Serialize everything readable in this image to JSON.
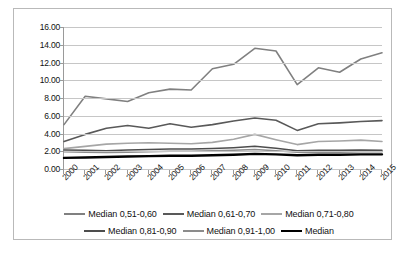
{
  "chart_data": {
    "type": "line",
    "title": "",
    "xlabel": "",
    "ylabel": "",
    "x": [
      "2000",
      "2001",
      "2002",
      "2003",
      "2004",
      "2005",
      "2006",
      "2007",
      "2008",
      "2009",
      "2010",
      "2011",
      "2012",
      "2013",
      "2014",
      "2015"
    ],
    "ylim": [
      0,
      16
    ],
    "ytick_step": 2.0,
    "ytick_labels": [
      "16.00",
      "14.00",
      "12.00",
      "10.00",
      "8.00",
      "6.00",
      "4.00",
      "2.00",
      "0.00"
    ],
    "grid": true,
    "legend_position": "bottom",
    "series": [
      {
        "name": "Median 0,51-0,60",
        "color": "#808080",
        "width": 1.6,
        "values": [
          5.0,
          8.2,
          7.9,
          7.6,
          8.6,
          9.0,
          8.9,
          11.3,
          11.8,
          13.6,
          13.3,
          9.5,
          11.4,
          10.9,
          12.4,
          13.1
        ]
      },
      {
        "name": "Median 0,61-0,70",
        "color": "#595959",
        "width": 1.6,
        "values": [
          3.1,
          3.9,
          4.6,
          4.9,
          4.6,
          5.1,
          4.7,
          5.0,
          5.4,
          5.75,
          5.5,
          4.35,
          5.1,
          5.2,
          5.35,
          5.45
        ]
      },
      {
        "name": "Median 0,71-0,80",
        "color": "#a6a6a6",
        "width": 1.6,
        "values": [
          2.3,
          2.55,
          2.8,
          2.9,
          2.95,
          2.9,
          2.85,
          3.0,
          3.35,
          3.9,
          3.3,
          2.75,
          3.1,
          3.15,
          3.25,
          3.1
        ]
      },
      {
        "name": "Median 0,81-0,90",
        "color": "#4d4d4d",
        "width": 1.5,
        "values": [
          2.15,
          2.1,
          2.05,
          2.15,
          2.2,
          2.25,
          2.25,
          2.3,
          2.4,
          2.55,
          2.35,
          2.05,
          2.1,
          2.1,
          2.15,
          2.1
        ]
      },
      {
        "name": "Median 0,91-1,00",
        "color": "#8c8c8c",
        "width": 1.5,
        "values": [
          1.95,
          1.9,
          1.85,
          1.9,
          1.95,
          2.0,
          2.0,
          2.05,
          2.1,
          2.2,
          2.05,
          1.9,
          1.9,
          1.9,
          1.95,
          1.95
        ]
      },
      {
        "name": "Median",
        "color": "#000000",
        "width": 2.4,
        "values": [
          1.25,
          1.3,
          1.35,
          1.4,
          1.45,
          1.5,
          1.5,
          1.55,
          1.6,
          1.7,
          1.65,
          1.55,
          1.6,
          1.6,
          1.65,
          1.65
        ]
      }
    ]
  },
  "legend": {
    "rows": [
      [
        "Median 0,51-0,60",
        "Median 0,61-0,70",
        "Median 0,71-0,80"
      ],
      [
        "Median 0,81-0,90",
        "Median 0,91-1,00",
        "Median"
      ]
    ]
  }
}
